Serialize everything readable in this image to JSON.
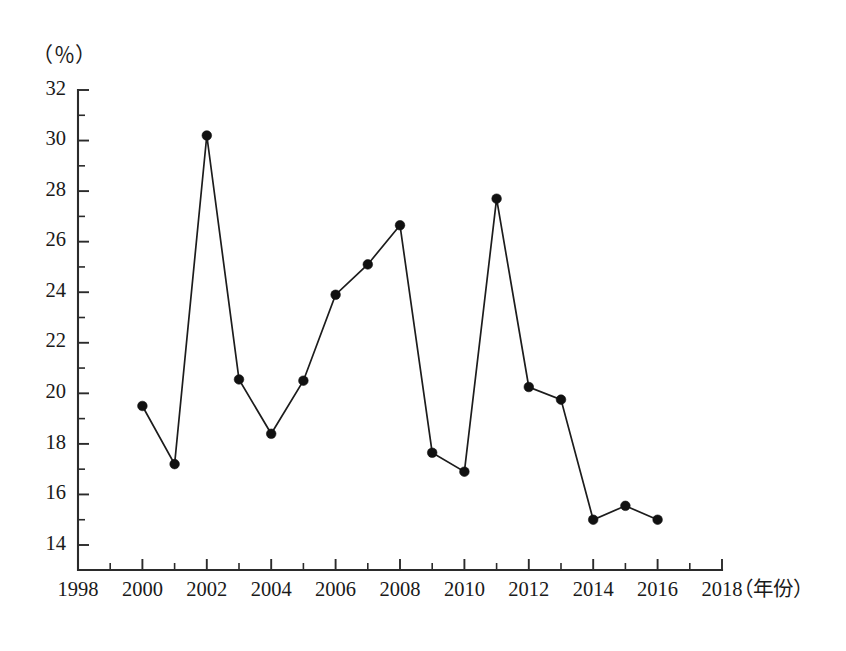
{
  "chart_data": {
    "type": "line",
    "title": "",
    "subtitle": "",
    "unit_label": "（％）",
    "xlabel": "（年份）",
    "ylabel": "",
    "x": [
      2000,
      2001,
      2002,
      2003,
      2004,
      2005,
      2006,
      2007,
      2008,
      2009,
      2010,
      2011,
      2012,
      2013,
      2014,
      2015,
      2016
    ],
    "values": [
      19.5,
      17.2,
      30.2,
      20.55,
      18.4,
      20.5,
      23.9,
      25.1,
      26.65,
      17.65,
      16.9,
      27.7,
      20.25,
      19.75,
      15.0,
      15.55,
      15.0
    ],
    "series": [
      {
        "name": "",
        "values": [
          19.5,
          17.2,
          30.2,
          20.55,
          18.4,
          20.5,
          23.9,
          25.1,
          26.65,
          17.65,
          16.9,
          27.7,
          20.25,
          19.75,
          15.0,
          15.55,
          15.0
        ]
      }
    ],
    "xlim": [
      1998,
      2018
    ],
    "ylim": [
      14,
      32
    ],
    "x_tick_labels": [
      "1998",
      "2000",
      "2002",
      "2004",
      "2006",
      "2008",
      "2010",
      "2012",
      "2014",
      "2016",
      "2018"
    ],
    "x_tick_values": [
      1998,
      2000,
      2002,
      2004,
      2006,
      2008,
      2010,
      2012,
      2014,
      2016,
      2018
    ],
    "x_minor_step": 1,
    "y_tick_labels": [
      "14",
      "16",
      "18",
      "20",
      "22",
      "24",
      "26",
      "28",
      "30",
      "32"
    ],
    "y_tick_values": [
      14,
      16,
      18,
      20,
      22,
      24,
      26,
      28,
      30,
      32
    ],
    "y_minor_step": 1,
    "grid": false,
    "legend": "none",
    "marker": "filled-circle",
    "line_color": "#1c1c1c",
    "marker_color": "#111111",
    "axis_color": "#2b2b2b",
    "background": "#ffffff"
  }
}
